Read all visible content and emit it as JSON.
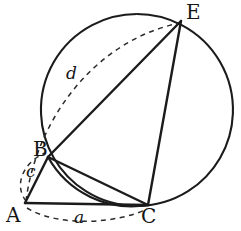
{
  "figure": {
    "type": "geometry-diagram",
    "width": 241,
    "height": 231,
    "background_color": "#ffffff",
    "stroke_color": "#1b1b1b"
  },
  "circle": {
    "name": "main-circle",
    "center_x": 137,
    "center_y": 110,
    "radius": 96
  },
  "vertices": [
    {
      "id": "A",
      "label": "A",
      "x": 25,
      "y": 203,
      "label_x": 6,
      "label_y": 205
    },
    {
      "id": "B",
      "label": "B",
      "x": 48,
      "y": 157,
      "label_x": 33,
      "label_y": 139
    },
    {
      "id": "C",
      "label": "C",
      "x": 148,
      "y": 205,
      "label_x": 141,
      "label_y": 206
    },
    {
      "id": "E",
      "label": "E",
      "x": 181,
      "y": 21,
      "label_x": 186,
      "label_y": 2
    }
  ],
  "segments": [
    {
      "id": "AC",
      "from": "A",
      "to": "C",
      "style": "solid"
    },
    {
      "id": "AB",
      "from": "A",
      "to": "B",
      "style": "solid"
    },
    {
      "id": "BE",
      "from": "B",
      "to": "E",
      "style": "solid"
    },
    {
      "id": "BC",
      "from": "B",
      "to": "C",
      "style": "solid"
    },
    {
      "id": "EC",
      "from": "E",
      "to": "C",
      "style": "solid"
    }
  ],
  "arcs": [
    {
      "id": "arc-BC",
      "from": "B",
      "to": "C",
      "style": "solid",
      "label": ""
    },
    {
      "id": "arc-AE",
      "from": "A",
      "to": "E",
      "style": "dashed",
      "label": "d"
    },
    {
      "id": "arc-AC",
      "from": "A",
      "to": "C",
      "style": "dashed",
      "label": "a"
    },
    {
      "id": "arc-AB",
      "from": "A",
      "to": "B",
      "style": "dashed",
      "label": "c"
    }
  ],
  "measure_labels": [
    {
      "id": "a",
      "text": "a",
      "x": 74,
      "y": 209
    },
    {
      "id": "c",
      "text": "c",
      "x": 26,
      "y": 163
    },
    {
      "id": "d",
      "text": "d",
      "x": 66,
      "y": 65
    }
  ],
  "paths": {
    "circle_outline": "M 137 14 A 96 96 0 1 1 136.9 14",
    "chord_AC": "M 25 203 L 148 205",
    "chord_AB": "M 25 203 L 48 157",
    "chord_BE": "M 48 157 L 181 21",
    "chord_BC": "M 48 157 L 148 205",
    "chord_EC": "M 181 21 L 148 205",
    "arc_BC_solid": "M 48 157 A 96 96 0 0 0 148 205",
    "arc_AE_dashed": "M 26 201 C 36 120 95 40 180 23",
    "arc_AC_dashed": "M 27 208 C 60 228 118 223 147 209",
    "arc_AB_dashed": "M 26 201 C 14 186 22 163 45 153"
  }
}
